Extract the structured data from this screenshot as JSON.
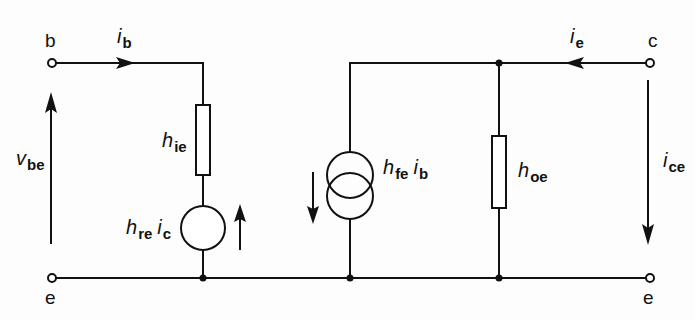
{
  "diagram": {
    "type": "h-parameter small-signal equivalent circuit (common emitter)",
    "terminals": {
      "base": "b",
      "emitter_left": "e",
      "collector": "c",
      "emitter_right": "e"
    },
    "labels": {
      "ib": {
        "main": "i",
        "sub": "b"
      },
      "ie": {
        "main": "i",
        "sub": "e"
      },
      "vbe": {
        "main": "v",
        "sub": "be"
      },
      "hie": {
        "main": "h",
        "sub": "ie"
      },
      "hre_ic": {
        "main": "h",
        "sub": "re",
        "main2": "i",
        "sub2": "c"
      },
      "hfe_ib": {
        "main": "h",
        "sub": "fe",
        "main2": "i",
        "sub2": "b"
      },
      "hoe": {
        "main": "h",
        "sub": "oe"
      },
      "ice": {
        "main": "i",
        "sub": "ce"
      }
    },
    "components": [
      {
        "id": "hie",
        "kind": "resistor",
        "branch": "input series"
      },
      {
        "id": "hre_ic",
        "kind": "voltage source",
        "direction": "up"
      },
      {
        "id": "hfe_ib",
        "kind": "current source",
        "direction": "down"
      },
      {
        "id": "hoe",
        "kind": "resistor",
        "branch": "output shunt"
      }
    ],
    "colors": {
      "ink": "#111111",
      "background": "#fdfdfd"
    }
  }
}
